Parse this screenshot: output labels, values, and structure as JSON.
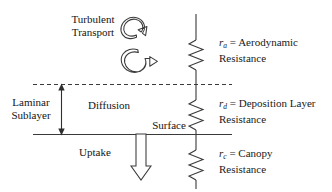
{
  "diagram": {
    "stroke_color": "#3a3a3a",
    "text_color": "#141414",
    "labels": {
      "turbulent_transport_line1": "Turbulent",
      "turbulent_transport_line2": "Transport",
      "laminar_sublayer_line1": "Laminar",
      "laminar_sublayer_line2": "Sublayer",
      "diffusion": "Diffusion",
      "surface": "Surface",
      "uptake": "Uptake"
    },
    "resistors": [
      {
        "id": "aerodynamic",
        "symbol": "r",
        "subscript": "a",
        "equals": " = ",
        "name_line1": "Aerodynamic",
        "name_line2": "Resistance"
      },
      {
        "id": "deposition-layer",
        "symbol": "r",
        "subscript": "d",
        "equals": " = ",
        "name_line1": "Deposition Layer",
        "name_line2": "Resistance"
      },
      {
        "id": "canopy",
        "symbol": "r",
        "subscript": "c",
        "equals": " = ",
        "name_line1": "Canopy",
        "name_line2": "Resistance"
      }
    ]
  }
}
